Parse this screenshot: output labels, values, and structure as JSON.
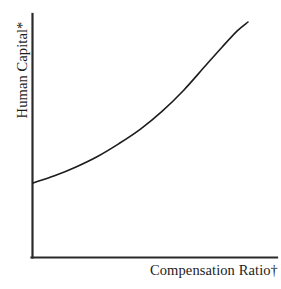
{
  "chart_data": {
    "type": "line",
    "title": "",
    "subtitle": "",
    "xlabel": "Compensation Ratio†",
    "ylabel": "Human Capital*",
    "grid": false,
    "legend": null,
    "legend_position": "none",
    "axis_style": "L-shaped spine, left and bottom only",
    "ticks": {
      "x": [],
      "y": [],
      "x_tick_labels": [],
      "y_tick_labels": [],
      "note": "Conceptual schematic: axes are unscaled with no tick marks or numeric labels"
    },
    "xlim": [
      0,
      1
    ],
    "ylim": [
      0,
      1
    ],
    "series": [
      {
        "name": "Human Capital curve",
        "shape": "convex increasing (exponential)",
        "color": "#1c1c1c",
        "linewidth": 1.6,
        "x": [
          0.0,
          0.1,
          0.2,
          0.3,
          0.4,
          0.5,
          0.6,
          0.7,
          0.8,
          0.88,
          0.95,
          1.0
        ],
        "y": [
          0.0,
          0.045,
          0.1,
          0.165,
          0.245,
          0.335,
          0.445,
          0.575,
          0.725,
          0.845,
          0.945,
          1.0
        ]
      }
    ],
    "annotations": [
      {
        "text": "*",
        "attached_to": "ylabel",
        "meaning": "footnote marker"
      },
      {
        "text": "†",
        "attached_to": "xlabel",
        "meaning": "footnote marker"
      }
    ],
    "colors": {
      "background": "#ffffff",
      "axis": "#2a2a2a",
      "curve": "#1c1c1c",
      "text": "#1c1c1c"
    }
  },
  "figure": {
    "x_axis_label": "Compensation Ratio†",
    "y_axis_label": "Human Capital*"
  }
}
